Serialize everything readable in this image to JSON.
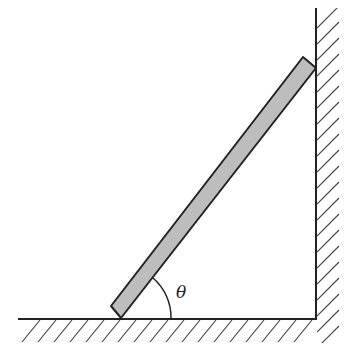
{
  "diagram": {
    "angle_label": "θ",
    "colors": {
      "line": "#222222",
      "ladder_fill": "#bdbdbd",
      "hatch": "#444444",
      "background": "#ffffff"
    }
  }
}
